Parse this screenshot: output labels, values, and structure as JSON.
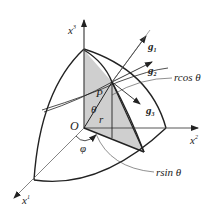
{
  "figure": {
    "type": "spherical-coordinates-diagram",
    "colors": {
      "stroke": "#222222",
      "axis": "#555555",
      "shade": "#cfcfcf",
      "background": "#ffffff"
    },
    "labels": {
      "x1": "x",
      "x1_sup": "1",
      "x2": "x",
      "x2_sup": "2",
      "x3": "x",
      "x3_sup": "3",
      "origin": "O",
      "point": "P",
      "theta": "θ",
      "phi": "φ",
      "radius": "r",
      "g1": "g",
      "g1_sub": "1",
      "g2": "g",
      "g2_sub": "2",
      "g3": "g",
      "g3_sub": "3",
      "rcos": "rcos θ",
      "rsin": "rsin θ"
    }
  }
}
